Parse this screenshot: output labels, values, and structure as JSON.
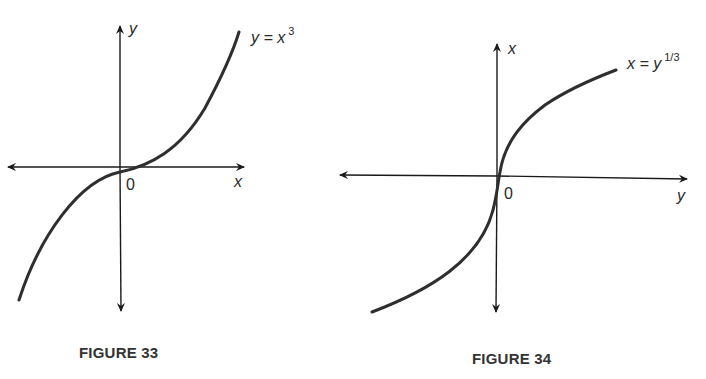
{
  "figures": [
    {
      "caption": "FIGURE 33",
      "vertical_axis_label": "y",
      "horizontal_axis_label": "x",
      "origin_label": "0",
      "curve_label": {
        "lhs": "y = x",
        "exponent": "3"
      },
      "equation": "y = x^3"
    },
    {
      "caption": "FIGURE 34",
      "vertical_axis_label": "x",
      "horizontal_axis_label": "y",
      "origin_label": "0",
      "curve_label": {
        "lhs": "x = y",
        "exponent": "1/3"
      },
      "equation": "x = y^(1/3)"
    }
  ],
  "colors": {
    "ink": "#2a2a2a",
    "background": "#ffffff"
  }
}
